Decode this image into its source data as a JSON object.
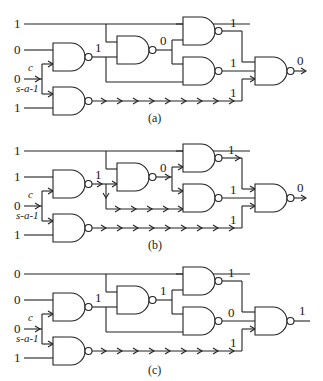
{
  "figure": {
    "fault": {
      "site_label": "c",
      "fault_label": "s-a-1"
    },
    "panels": [
      {
        "caption": "(a)",
        "inputs": [
          "1",
          "0",
          "0",
          "1"
        ],
        "g1_out": "1",
        "g_mid_out": "0",
        "top_right_out": "1",
        "bottom_right_out": "1",
        "low_path_out": "1",
        "final_out": "0"
      },
      {
        "caption": "(b)",
        "inputs": [
          "1",
          "1",
          "0",
          "1"
        ],
        "g1_out": "1",
        "g_mid_out": "0",
        "top_right_out": "1",
        "bottom_right_out": "1",
        "low_path_out": "1",
        "final_out": "0"
      },
      {
        "caption": "(c)",
        "inputs": [
          "0",
          "0",
          "0",
          "1"
        ],
        "g1_out": "1",
        "g_mid_out": "1",
        "top_right_out": "1",
        "bottom_right_out": "0",
        "low_path_out": "1",
        "final_out": "1"
      }
    ]
  }
}
